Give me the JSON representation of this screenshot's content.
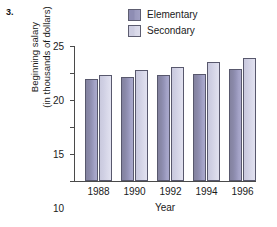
{
  "item_number": "3.",
  "legend": {
    "position": "top-center",
    "entries": [
      {
        "label": "Elementary",
        "color": "#9392b6",
        "swatch_name": "legend-swatch-elementary"
      },
      {
        "label": "Secondary",
        "color": "#d5d5e7",
        "swatch_name": "legend-swatch-secondary"
      }
    ]
  },
  "axes": {
    "ylabel_line1": "Beginning salary",
    "ylabel_line2": "(in thousands of dollars)",
    "xlabel": "Year",
    "yticks": [
      "0",
      "5",
      "10",
      "15",
      "20",
      "25"
    ]
  },
  "chart_data": {
    "type": "bar",
    "title": "",
    "subtitle": "",
    "xlabel": "Year",
    "ylabel": "Beginning salary (in thousands of dollars)",
    "categories": [
      "1988",
      "1990",
      "1992",
      "1994",
      "1996"
    ],
    "series": [
      {
        "name": "Elementary",
        "color": "#9392b6",
        "values": [
          18.9,
          19.2,
          19.6,
          19.9,
          20.8
        ]
      },
      {
        "name": "Secondary",
        "color": "#d5d5e7",
        "values": [
          19.7,
          20.5,
          21.1,
          22.0,
          22.7
        ]
      }
    ],
    "ylim": [
      0,
      25
    ],
    "ytick_values": [
      0,
      5,
      10,
      15,
      20,
      25
    ],
    "grid": false,
    "legend": "top-center"
  }
}
